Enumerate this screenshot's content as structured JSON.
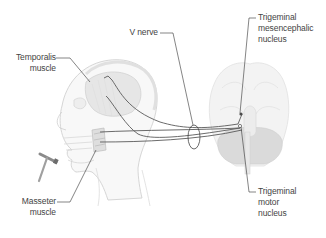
{
  "diagram": {
    "colors": {
      "background": "#ffffff",
      "label_text": "#444444",
      "leader_line": "#333333",
      "nerve_line": "#555555",
      "head_outline": "#d9d9d9",
      "head_fill": "#f7f7f7",
      "temporalis_fill": "#e4e4e4",
      "brain_fill": "#f2f2f2",
      "cerebellum_fill": "#dcdcdc"
    },
    "labels": {
      "temporalis": {
        "line1": "Temporalis",
        "line2": "muscle"
      },
      "v_nerve": {
        "line1": "V nerve"
      },
      "mesencephalic": {
        "line1": "Trigeminal",
        "line2": "mesencephalic",
        "line3": "nucleus"
      },
      "masseter": {
        "line1": "Masseter",
        "line2": "muscle"
      },
      "motor": {
        "line1": "Trigeminal",
        "line2": "motor",
        "line3": "nucleus"
      }
    },
    "icons": [
      "head-profile-icon",
      "reflex-hammer-icon",
      "brain-inferior-view-icon",
      "nerve-bundle-ellipse-icon"
    ]
  }
}
